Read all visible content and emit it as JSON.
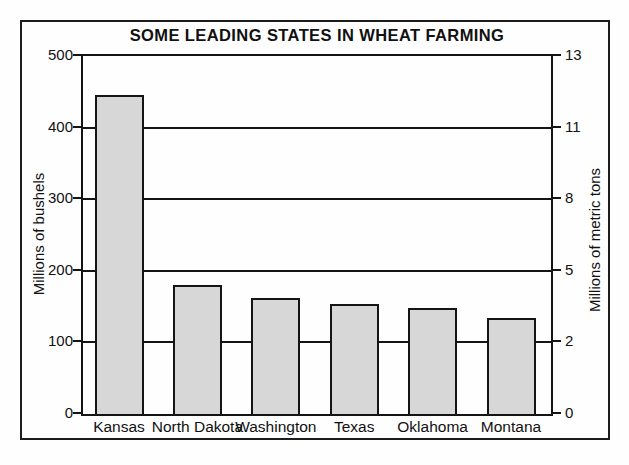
{
  "chart_data": {
    "type": "bar",
    "title": "SOME LEADING STATES IN WHEAT FARMING",
    "categories": [
      "Kansas",
      "North Dakota",
      "Washington",
      "Texas",
      "Oklahoma",
      "Montana"
    ],
    "values": [
      445,
      180,
      162,
      153,
      148,
      134
    ],
    "values_unit": "millions of bushels",
    "ylabel_left": "Millions of bushels",
    "ylabel_right": "Millions of metric tons",
    "ylim_left": [
      0,
      500
    ],
    "left_axis_ticks": [
      500,
      400,
      300,
      200,
      100,
      0
    ],
    "right_axis_ticks": [
      13,
      11,
      8,
      5,
      2,
      0
    ],
    "right_ticks_aligned_with_left_gridlines": true,
    "grid": true,
    "legend": "none",
    "colors": {
      "bar_fill": "#d7d7d7",
      "bar_border": "#141414",
      "frame": "#1c1c1c",
      "background": "#fefefe",
      "text": "#111111"
    }
  }
}
